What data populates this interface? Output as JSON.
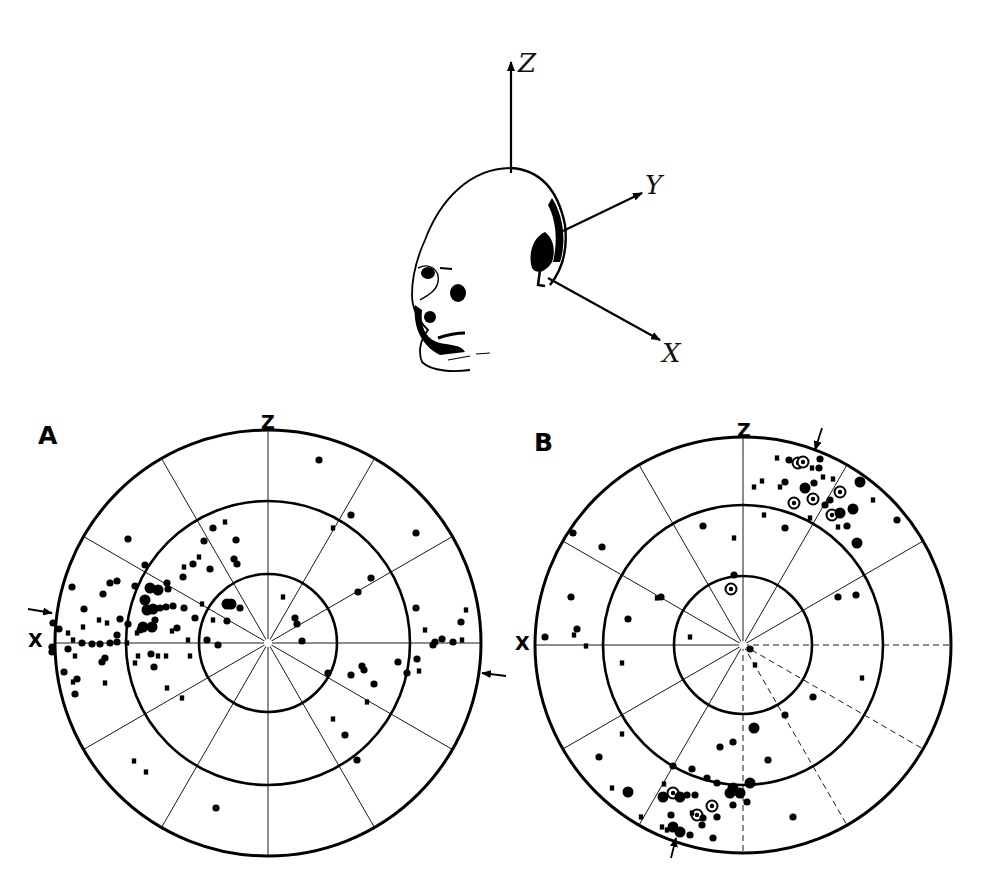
{
  "figure": {
    "head_diagram": {
      "axes": [
        {
          "label": "Z",
          "from": [
            511,
            173
          ],
          "to": [
            511,
            62
          ],
          "label_pos": [
            518,
            50
          ]
        },
        {
          "label": "Y",
          "from": [
            563,
            231
          ],
          "to": [
            642,
            193
          ],
          "label_pos": [
            645,
            172
          ]
        },
        {
          "label": "X",
          "from": [
            548,
            278
          ],
          "to": [
            660,
            340
          ],
          "label_pos": [
            662,
            340
          ]
        }
      ]
    },
    "panels": [
      {
        "id": "A",
        "label": "A",
        "label_pos": [
          38,
          423
        ],
        "center": [
          268,
          643
        ],
        "radii": [
          213,
          142,
          69
        ],
        "z_label": "Z",
        "z_label_pos": [
          261,
          413
        ],
        "x_label": "X",
        "x_label_pos": [
          28,
          631
        ],
        "arrows": [
          {
            "from": [
              28,
              609
            ],
            "to": [
              52,
              613
            ]
          },
          {
            "from": [
              506,
              676
            ],
            "to": [
              482,
              673
            ]
          }
        ],
        "dashed_sectors": [],
        "points": [
          [
            319,
            460,
            "d"
          ],
          [
            351,
            515,
            "d"
          ],
          [
            416,
            533,
            "d"
          ],
          [
            333,
            528,
            "s"
          ],
          [
            128,
            539,
            "d"
          ],
          [
            213,
            528,
            "d"
          ],
          [
            225,
            522,
            "s"
          ],
          [
            204,
            541,
            "d"
          ],
          [
            236,
            540,
            "d"
          ],
          [
            234,
            559,
            "d"
          ],
          [
            237,
            564,
            "d"
          ],
          [
            145,
            565,
            "d"
          ],
          [
            193,
            564,
            "d"
          ],
          [
            210,
            569,
            "d"
          ],
          [
            184,
            567,
            "s"
          ],
          [
            199,
            557,
            "s"
          ],
          [
            183,
            577,
            "d"
          ],
          [
            72,
            587,
            "d"
          ],
          [
            110,
            583,
            "d"
          ],
          [
            117,
            581,
            "d"
          ],
          [
            103,
            594,
            "d"
          ],
          [
            135,
            586,
            "d"
          ],
          [
            150,
            588,
            "b"
          ],
          [
            158,
            590,
            "b"
          ],
          [
            167,
            583,
            "d"
          ],
          [
            168,
            589,
            "d"
          ],
          [
            371,
            578,
            "d"
          ],
          [
            358,
            592,
            "d"
          ],
          [
            84,
            609,
            "d"
          ],
          [
            145,
            600,
            "b"
          ],
          [
            147,
            610,
            "b"
          ],
          [
            153,
            609,
            "b"
          ],
          [
            160,
            608,
            "d"
          ],
          [
            166,
            607,
            "d"
          ],
          [
            173,
            606,
            "d"
          ],
          [
            227,
            604,
            "b"
          ],
          [
            231,
            604,
            "b"
          ],
          [
            240,
            608,
            "d"
          ],
          [
            202,
            604,
            "s"
          ],
          [
            184,
            608,
            "d"
          ],
          [
            283,
            597,
            "s"
          ],
          [
            416,
            608,
            "d"
          ],
          [
            466,
            610,
            "s"
          ],
          [
            120,
            619,
            "d"
          ],
          [
            99,
            620,
            "s"
          ],
          [
            107,
            623,
            "s"
          ],
          [
            83,
            627,
            "s"
          ],
          [
            195,
            618,
            "d"
          ],
          [
            213,
            620,
            "s"
          ],
          [
            227,
            621,
            "d"
          ],
          [
            295,
            618,
            "d"
          ],
          [
            297,
            624,
            "d"
          ],
          [
            461,
            622,
            "d"
          ],
          [
            425,
            630,
            "s"
          ],
          [
            143,
            627,
            "b"
          ],
          [
            152,
            627,
            "b"
          ],
          [
            155,
            620,
            "d"
          ],
          [
            140,
            630,
            "d"
          ],
          [
            177,
            628,
            "d"
          ],
          [
            172,
            631,
            "s"
          ],
          [
            128,
            624,
            "d"
          ],
          [
            59,
            629,
            "d"
          ],
          [
            53,
            623,
            "d"
          ],
          [
            68,
            633,
            "s"
          ],
          [
            82,
            643,
            "d"
          ],
          [
            92,
            644,
            "d"
          ],
          [
            100,
            644,
            "d"
          ],
          [
            110,
            643,
            "d"
          ],
          [
            117,
            642,
            "d"
          ],
          [
            73,
            640,
            "s"
          ],
          [
            127,
            643,
            "s"
          ],
          [
            117,
            635,
            "d"
          ],
          [
            137,
            633,
            "s"
          ],
          [
            188,
            640,
            "s"
          ],
          [
            207,
            640,
            "d"
          ],
          [
            218,
            645,
            "d"
          ],
          [
            302,
            641,
            "d"
          ],
          [
            435,
            642,
            "d"
          ],
          [
            442,
            639,
            "d"
          ],
          [
            453,
            642,
            "d"
          ],
          [
            462,
            640,
            "s"
          ],
          [
            433,
            645,
            "d"
          ],
          [
            52,
            647,
            "d"
          ],
          [
            52,
            652,
            "d"
          ],
          [
            68,
            649,
            "d"
          ],
          [
            75,
            656,
            "s"
          ],
          [
            105,
            658,
            "d"
          ],
          [
            102,
            662,
            "d"
          ],
          [
            138,
            656,
            "s"
          ],
          [
            151,
            654,
            "d"
          ],
          [
            158,
            656,
            "s"
          ],
          [
            166,
            656,
            "s"
          ],
          [
            190,
            656,
            "s"
          ],
          [
            135,
            663,
            "s"
          ],
          [
            154,
            667,
            "d"
          ],
          [
            398,
            662,
            "d"
          ],
          [
            417,
            659,
            "d"
          ],
          [
            362,
            666,
            "d"
          ],
          [
            364,
            670,
            "d"
          ],
          [
            407,
            673,
            "d"
          ],
          [
            419,
            671,
            "s"
          ],
          [
            328,
            673,
            "d"
          ],
          [
            351,
            675,
            "d"
          ],
          [
            374,
            684,
            "d"
          ],
          [
            64,
            672,
            "d"
          ],
          [
            73,
            682,
            "s"
          ],
          [
            77,
            679,
            "d"
          ],
          [
            75,
            694,
            "d"
          ],
          [
            105,
            683,
            "s"
          ],
          [
            167,
            688,
            "s"
          ],
          [
            182,
            698,
            "s"
          ],
          [
            367,
            702,
            "s"
          ],
          [
            333,
            719,
            "s"
          ],
          [
            345,
            735,
            "d"
          ],
          [
            357,
            760,
            "d"
          ],
          [
            134,
            761,
            "s"
          ],
          [
            146,
            772,
            "s"
          ],
          [
            216,
            808,
            "d"
          ]
        ]
      },
      {
        "id": "B",
        "label": "B",
        "label_pos": [
          534,
          430
        ],
        "center": [
          743,
          645
        ],
        "radii": [
          208,
          140,
          69
        ],
        "z_label": "Z",
        "z_label_pos": [
          737,
          421
        ],
        "x_label": "X",
        "x_label_pos": [
          515,
          634
        ],
        "arrows": [
          {
            "from": [
              822,
              428
            ],
            "to": [
              815,
              450
            ]
          },
          {
            "from": [
              671,
              858
            ],
            "to": [
              676,
              838
            ]
          }
        ],
        "dashed_sectors": [
          90,
          120,
          150,
          180,
          210
        ],
        "points": [
          [
            777,
            458,
            "s"
          ],
          [
            789,
            460,
            "d"
          ],
          [
            798,
            463,
            "c"
          ],
          [
            803,
            462,
            "c"
          ],
          [
            820,
            459,
            "d"
          ],
          [
            812,
            468,
            "s"
          ],
          [
            819,
            468,
            "d"
          ],
          [
            762,
            481,
            "s"
          ],
          [
            754,
            487,
            "s"
          ],
          [
            785,
            482,
            "d"
          ],
          [
            780,
            487,
            "s"
          ],
          [
            814,
            483,
            "d"
          ],
          [
            823,
            477,
            "s"
          ],
          [
            833,
            479,
            "s"
          ],
          [
            805,
            488,
            "b"
          ],
          [
            840,
            492,
            "c"
          ],
          [
            860,
            482,
            "b"
          ],
          [
            794,
            503,
            "c"
          ],
          [
            813,
            499,
            "c"
          ],
          [
            825,
            505,
            "d"
          ],
          [
            830,
            500,
            "d"
          ],
          [
            873,
            500,
            "s"
          ],
          [
            832,
            515,
            "c"
          ],
          [
            840,
            513,
            "b"
          ],
          [
            853,
            509,
            "b"
          ],
          [
            810,
            518,
            "s"
          ],
          [
            764,
            515,
            "s"
          ],
          [
            838,
            527,
            "s"
          ],
          [
            847,
            526,
            "d"
          ],
          [
            897,
            520,
            "d"
          ],
          [
            857,
            543,
            "b"
          ],
          [
            703,
            526,
            "d"
          ],
          [
            785,
            528,
            "d"
          ],
          [
            734,
            538,
            "s"
          ],
          [
            573,
            533,
            "d"
          ],
          [
            602,
            547,
            "d"
          ],
          [
            734,
            575,
            "d"
          ],
          [
            731,
            589,
            "c"
          ],
          [
            661,
            597,
            "d"
          ],
          [
            657,
            598,
            "s"
          ],
          [
            838,
            597,
            "d"
          ],
          [
            856,
            595,
            "d"
          ],
          [
            571,
            597,
            "d"
          ],
          [
            628,
            619,
            "d"
          ],
          [
            577,
            629,
            "d"
          ],
          [
            574,
            635,
            "s"
          ],
          [
            690,
            637,
            "s"
          ],
          [
            545,
            637,
            "d"
          ],
          [
            586,
            646,
            "s"
          ],
          [
            750,
            649,
            "d"
          ],
          [
            755,
            665,
            "s"
          ],
          [
            622,
            663,
            "s"
          ],
          [
            862,
            678,
            "s"
          ],
          [
            813,
            697,
            "d"
          ],
          [
            785,
            715,
            "d"
          ],
          [
            754,
            728,
            "b"
          ],
          [
            720,
            747,
            "d"
          ],
          [
            733,
            742,
            "d"
          ],
          [
            622,
            734,
            "s"
          ],
          [
            599,
            757,
            "d"
          ],
          [
            768,
            760,
            "d"
          ],
          [
            673,
            766,
            "d"
          ],
          [
            692,
            769,
            "d"
          ],
          [
            707,
            778,
            "d"
          ],
          [
            717,
            783,
            "d"
          ],
          [
            733,
            788,
            "b"
          ],
          [
            740,
            793,
            "b"
          ],
          [
            750,
            783,
            "b"
          ],
          [
            730,
            793,
            "b"
          ],
          [
            612,
            788,
            "s"
          ],
          [
            628,
            792,
            "b"
          ],
          [
            664,
            784,
            "s"
          ],
          [
            663,
            797,
            "b"
          ],
          [
            673,
            793,
            "c"
          ],
          [
            680,
            797,
            "b"
          ],
          [
            687,
            795,
            "d"
          ],
          [
            695,
            795,
            "d"
          ],
          [
            712,
            806,
            "c"
          ],
          [
            733,
            805,
            "d"
          ],
          [
            747,
            802,
            "d"
          ],
          [
            671,
            815,
            "d"
          ],
          [
            697,
            815,
            "c"
          ],
          [
            692,
            813,
            "s"
          ],
          [
            703,
            818,
            "d"
          ],
          [
            717,
            817,
            "d"
          ],
          [
            702,
            825,
            "d"
          ],
          [
            641,
            817,
            "s"
          ],
          [
            673,
            827,
            "b"
          ],
          [
            680,
            832,
            "b"
          ],
          [
            690,
            835,
            "d"
          ],
          [
            667,
            830,
            "s"
          ],
          [
            662,
            827,
            "s"
          ],
          [
            713,
            838,
            "d"
          ],
          [
            793,
            817,
            "d"
          ]
        ]
      }
    ],
    "legend_point_types": {
      "d": "filled-dot",
      "b": "large-filled-dot",
      "s": "small-square",
      "c": "circled-dot"
    },
    "colors": {
      "ink": "#000000",
      "paper": "#ffffff"
    }
  }
}
